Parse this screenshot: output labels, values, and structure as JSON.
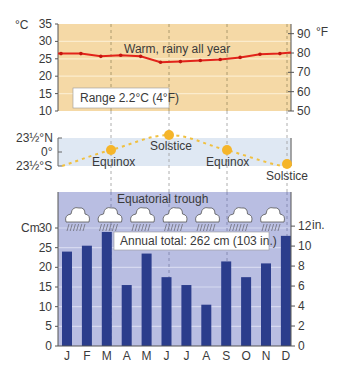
{
  "chart_data": [
    {
      "type": "line",
      "title": "Warm, rainy all year",
      "xlabel": "",
      "ylabel": "°C",
      "ylabel_right": "°F",
      "categories": [
        "J",
        "F",
        "M",
        "A",
        "M",
        "J",
        "J",
        "A",
        "S",
        "O",
        "N",
        "D"
      ],
      "series": [
        {
          "name": "Temperature (°C)",
          "values": [
            26.5,
            26.5,
            25.7,
            26.0,
            25.7,
            24.0,
            24.2,
            24.5,
            24.8,
            25.4,
            26.3,
            26.5
          ]
        }
      ],
      "ylim": [
        10,
        35
      ],
      "yticks": [
        10,
        15,
        20,
        25,
        30,
        35
      ],
      "yticks_right": [
        50,
        60,
        70,
        80,
        90
      ],
      "annotation": "Range 2.2°C (4°F)",
      "grid": true,
      "color": "#e2231a"
    },
    {
      "type": "line",
      "title": "Sun declination",
      "yticks": [
        "23½°S",
        "0°",
        "23½°N"
      ],
      "ylim": [
        -23.5,
        23.5
      ],
      "events": [
        {
          "label": "Equinox",
          "month": "M",
          "value": 0
        },
        {
          "label": "Solstice",
          "month": "J",
          "value": 23.5
        },
        {
          "label": "Equinox",
          "month": "S",
          "value": 0
        },
        {
          "label": "Solstice",
          "month": "D",
          "value": -23.5
        }
      ],
      "color": "#f5b52a"
    },
    {
      "type": "bar",
      "title": "Equatorial trough",
      "ylabel": "Cm",
      "ylabel_right": "in.",
      "categories": [
        "J",
        "F",
        "M",
        "A",
        "M",
        "J",
        "J",
        "A",
        "S",
        "O",
        "N",
        "D"
      ],
      "values": [
        24,
        25.5,
        29,
        15.5,
        23.5,
        17.5,
        15.5,
        10.5,
        21.5,
        17.5,
        21,
        28
      ],
      "ylim": [
        0,
        30
      ],
      "yticks": [
        0,
        5,
        10,
        15,
        20,
        25,
        30
      ],
      "yticks_right": [
        0,
        2,
        4,
        6,
        8,
        10,
        12
      ],
      "annotation": "Annual total: 262 cm (103 in.)",
      "grid": true,
      "color": "#2b3d8c"
    }
  ],
  "labels": {
    "temp_unit_left": "°C",
    "temp_unit_right": "°F",
    "temp_title": "Warm, rainy all year",
    "range_note": "Range 2.2°C (4°F)",
    "sun_n": "23½°N",
    "sun_0": "0°",
    "sun_s": "23½°S",
    "equinox": "Equinox",
    "solstice": "Solstice",
    "trough": "Equatorial trough",
    "precip_unit_left": "Cm",
    "precip_unit_right": "in.",
    "annual_total": "Annual total: 262 cm (103 in.)"
  },
  "icons": {
    "cloud": "rain-cloud-icon",
    "count": 7
  },
  "colors": {
    "temp_bg": "#f5d9a6",
    "sun_bg": "#dfe8f3",
    "precip_bg": "#b9bee2",
    "bar": "#2b3d8c",
    "temp_line": "#e2231a",
    "sun": "#f5b52a"
  }
}
